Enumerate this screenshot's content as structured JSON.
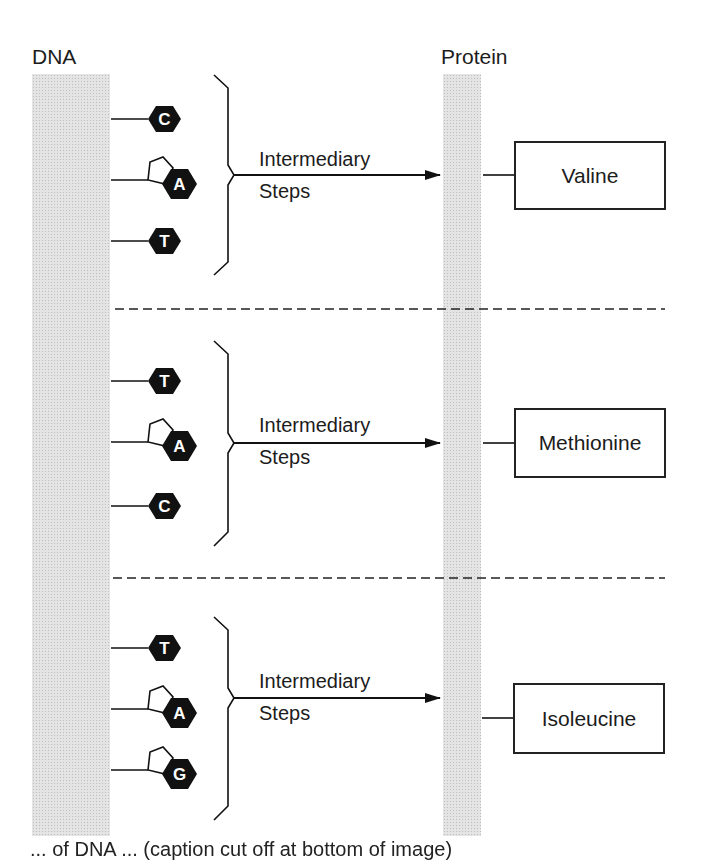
{
  "labels": {
    "dna": "DNA",
    "protein": "Protein"
  },
  "groups": [
    {
      "bases": [
        {
          "letter": "C",
          "type": "pyrimidine"
        },
        {
          "letter": "A",
          "type": "purine"
        },
        {
          "letter": "T",
          "type": "pyrimidine"
        }
      ],
      "steps_line1": "Intermediary",
      "steps_line2": "Steps",
      "amino_acid": "Valine"
    },
    {
      "bases": [
        {
          "letter": "T",
          "type": "pyrimidine"
        },
        {
          "letter": "A",
          "type": "purine"
        },
        {
          "letter": "C",
          "type": "pyrimidine"
        }
      ],
      "steps_line1": "Intermediary",
      "steps_line2": "Steps",
      "amino_acid": "Methionine"
    },
    {
      "bases": [
        {
          "letter": "T",
          "type": "pyrimidine"
        },
        {
          "letter": "A",
          "type": "purine"
        },
        {
          "letter": "G",
          "type": "purine"
        }
      ],
      "steps_line1": "Intermediary",
      "steps_line2": "Steps",
      "amino_acid": "Isoleucine"
    }
  ],
  "caption": "... of DNA ... (caption cut off at bottom of image)"
}
